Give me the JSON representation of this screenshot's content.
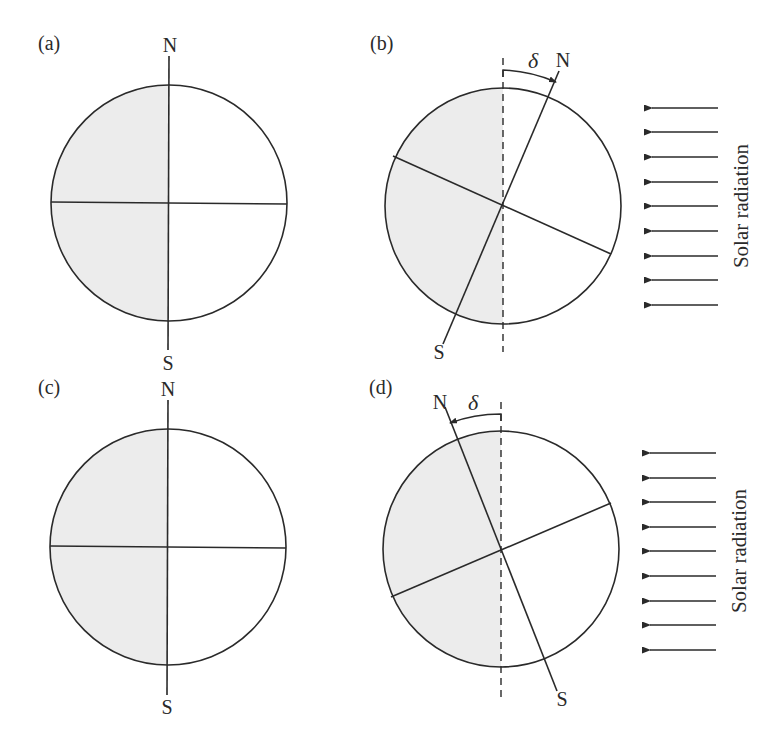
{
  "figure": {
    "shade_color": "#ececec",
    "line_color": "#2a2a2a"
  },
  "panels": [
    {
      "id": "a",
      "label": "(a)",
      "north": "N",
      "south": "S",
      "tilted": false
    },
    {
      "id": "b",
      "label": "(b)",
      "north": "N",
      "south": "S",
      "tilted": true,
      "angle_symbol": "δ",
      "radiation_label": "Solar radiation",
      "arrow_count": 9
    },
    {
      "id": "c",
      "label": "(c)",
      "north": "N",
      "south": "S",
      "tilted": false
    },
    {
      "id": "d",
      "label": "(d)",
      "north": "N",
      "south": "S",
      "tilted": true,
      "angle_symbol": "δ",
      "radiation_label": "Solar radiation",
      "arrow_count": 9
    }
  ]
}
